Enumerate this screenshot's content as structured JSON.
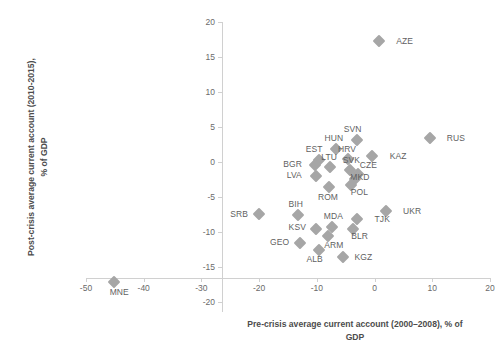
{
  "chart_data": {
    "type": "scatter",
    "title": "",
    "xlabel": "Pre-crisis average current account (2000–2008), % of GDP",
    "ylabel": "Post-crisis average current account (2010-2015), % of GDP",
    "xlim": [
      -50,
      20
    ],
    "ylim": [
      -20,
      20
    ],
    "xticks": [
      -50,
      -40,
      -30,
      -20,
      -10,
      0,
      10,
      20
    ],
    "xtick_labels": [
      "-50",
      "-40",
      "-30",
      "-20",
      "-10",
      "0",
      "10",
      "20"
    ],
    "yticks": [
      -20,
      -15,
      -10,
      -5,
      0,
      5,
      10,
      15,
      20
    ],
    "ytick_labels": [
      "-20",
      "-15",
      "-10",
      "-5",
      "0",
      "5",
      "10",
      "15",
      "20"
    ],
    "grid": false,
    "legend": "none",
    "marker": "diamond",
    "marker_color": "#a6a6a6",
    "points": [
      {
        "label": "AZE",
        "x": 0.7,
        "y": 17.3,
        "label_dx": 26,
        "label_dy": 0
      },
      {
        "label": "RUS",
        "x": 9.6,
        "y": 3.4,
        "label_dx": 26,
        "label_dy": 0
      },
      {
        "label": "SVN",
        "x": -3.1,
        "y": 3.1,
        "label_dx": -4,
        "label_dy": -11
      },
      {
        "label": "HUN",
        "x": -6.7,
        "y": 1.9,
        "label_dx": -2,
        "label_dy": -11
      },
      {
        "label": "KAZ",
        "x": -0.4,
        "y": 0.9,
        "label_dx": 26,
        "label_dy": 0
      },
      {
        "label": "HRV",
        "x": -4.6,
        "y": 0.4,
        "label_dx": -1,
        "label_dy": -10
      },
      {
        "label": "EST",
        "x": -9.6,
        "y": 0.3,
        "label_dx": -5,
        "label_dy": -11
      },
      {
        "label": "BGR",
        "x": -10.4,
        "y": -0.4,
        "label_dx": -22,
        "label_dy": -1
      },
      {
        "label": "LTU",
        "x": -7.7,
        "y": -0.7,
        "label_dx": -1,
        "label_dy": -10
      },
      {
        "label": "SVK",
        "x": -4.2,
        "y": -1.1,
        "label_dx": 1,
        "label_dy": -10
      },
      {
        "label": "CZE",
        "x": -2.8,
        "y": -1.7,
        "label_dx": 10,
        "label_dy": -9
      },
      {
        "label": "LVA",
        "x": -10.1,
        "y": -2.0,
        "label_dx": -22,
        "label_dy": -1
      },
      {
        "label": "MKD",
        "x": -3.4,
        "y": -2.4,
        "label_dx": 5,
        "label_dy": -2
      },
      {
        "label": "POL",
        "x": -4.0,
        "y": -3.3,
        "label_dx": 8,
        "label_dy": 7
      },
      {
        "label": "ROM",
        "x": -7.9,
        "y": -3.6,
        "label_dx": -1,
        "label_dy": 10
      },
      {
        "label": "SRB",
        "x": -20.0,
        "y": -7.4,
        "label_dx": -20,
        "label_dy": 0
      },
      {
        "label": "UKR",
        "x": 2.0,
        "y": -7.0,
        "label_dx": 26,
        "label_dy": 0
      },
      {
        "label": "BIH",
        "x": -13.3,
        "y": -7.6,
        "label_dx": -2,
        "label_dy": -11
      },
      {
        "label": "TJK",
        "x": -3.0,
        "y": -8.2,
        "label_dx": 25,
        "label_dy": 0
      },
      {
        "label": "MDA",
        "x": -7.3,
        "y": -9.3,
        "label_dx": 1,
        "label_dy": -11
      },
      {
        "label": "KSV",
        "x": -10.1,
        "y": -9.6,
        "label_dx": -19,
        "label_dy": -2
      },
      {
        "label": "BLR",
        "x": -3.8,
        "y": -9.5,
        "label_dx": 7,
        "label_dy": 7
      },
      {
        "label": "ARM",
        "x": -8.1,
        "y": -10.5,
        "label_dx": 6,
        "label_dy": 9
      },
      {
        "label": "GEO",
        "x": -13.0,
        "y": -11.5,
        "label_dx": -20,
        "label_dy": -1
      },
      {
        "label": "ALB",
        "x": -9.7,
        "y": -12.5,
        "label_dx": -4,
        "label_dy": 9
      },
      {
        "label": "KGZ",
        "x": -5.4,
        "y": -13.6,
        "label_dx": 20,
        "label_dy": 0
      },
      {
        "label": "MNE",
        "x": -45.1,
        "y": -17.2,
        "label_dx": 5,
        "label_dy": 10
      }
    ]
  }
}
